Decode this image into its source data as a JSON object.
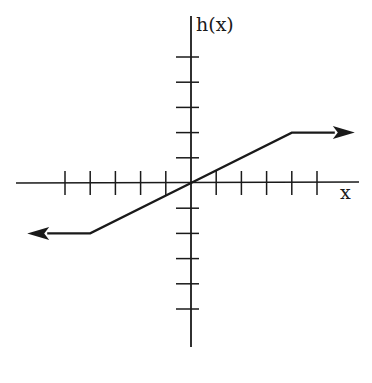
{
  "chart_data": {
    "type": "line",
    "title": "",
    "xlabel": "x",
    "ylabel": "h(x)",
    "grid": false,
    "legend": null,
    "xlim": [
      -5,
      6
    ],
    "ylim": [
      -5,
      5
    ],
    "x_ticks": [
      -5,
      -4,
      -3,
      -2,
      -1,
      1,
      2,
      3,
      4,
      5
    ],
    "y_ticks": [
      -5,
      -4,
      -3,
      -2,
      -1,
      1,
      2,
      3,
      4,
      5
    ],
    "tick_labels_shown": false,
    "series": [
      {
        "name": "h(x)",
        "x": [
          -6.5,
          -4,
          0,
          4,
          6.5
        ],
        "y": [
          -2,
          -2,
          0,
          2,
          2
        ],
        "arrow_left": true,
        "arrow_right": true,
        "description": "h(x) = -2 for x < -4; h(x) = x/2 for -4 <= x <= 4; h(x) = 2 for x > 4"
      }
    ]
  },
  "layout": {
    "origin_px": [
      191,
      183
    ],
    "unit_px": 25.2,
    "x_axis_px": [
      16,
      359
    ],
    "y_axis_px": [
      16,
      347
    ],
    "line_color": "#1a1a1a"
  },
  "labels": {
    "y_axis": "h(x)",
    "x_axis": "x"
  }
}
